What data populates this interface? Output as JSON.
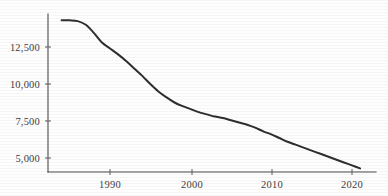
{
  "chart_data": {
    "type": "line",
    "title": "",
    "subtitle": "",
    "xlabel": "",
    "ylabel": "",
    "legend": [],
    "legend_position": "none",
    "grid": false,
    "xlim": [
      1984,
      2021
    ],
    "ylim": [
      3800,
      14800
    ],
    "x_ticks": [
      1990,
      2000,
      2010,
      2020
    ],
    "x_tick_labels": [
      "1990",
      "2000",
      "2010",
      "2020"
    ],
    "y_ticks": [
      5000,
      7500,
      10000,
      12500
    ],
    "y_tick_labels": [
      "5,000",
      "7,500",
      "10,000",
      "12,500"
    ],
    "line_color": "#2e2e2e",
    "axis_color": "#4a4a4a",
    "background_color": "#ffffff",
    "x": [
      1984,
      1985,
      1986,
      1987,
      1988,
      1989,
      1990,
      1991,
      1992,
      1993,
      1994,
      1995,
      1996,
      1997,
      1998,
      1999,
      2000,
      2001,
      2002,
      2003,
      2004,
      2005,
      2006,
      2007,
      2008,
      2009,
      2010,
      2011,
      2012,
      2013,
      2014,
      2015,
      2016,
      2017,
      2018,
      2019,
      2020,
      2021
    ],
    "values": [
      14300,
      14300,
      14250,
      14000,
      13450,
      12800,
      12400,
      12000,
      11550,
      11050,
      10550,
      10000,
      9500,
      9100,
      8750,
      8500,
      8300,
      8100,
      7950,
      7800,
      7700,
      7550,
      7400,
      7250,
      7050,
      6800,
      6600,
      6350,
      6100,
      5900,
      5700,
      5500,
      5300,
      5100,
      4900,
      4700,
      4500,
      4300
    ],
    "series": [
      {
        "name": "value",
        "values": [
          14300,
          14300,
          14250,
          14000,
          13450,
          12800,
          12400,
          12000,
          11550,
          11050,
          10550,
          10000,
          9500,
          9100,
          8750,
          8500,
          8300,
          8100,
          7950,
          7800,
          7700,
          7550,
          7400,
          7250,
          7050,
          6800,
          6600,
          6350,
          6100,
          5900,
          5700,
          5500,
          5300,
          5100,
          4900,
          4700,
          4500,
          4300
        ]
      }
    ],
    "annotations": []
  },
  "figure": {
    "axis_region": {
      "left": 48,
      "right": 376,
      "top": 14,
      "bottom": 172
    }
  }
}
